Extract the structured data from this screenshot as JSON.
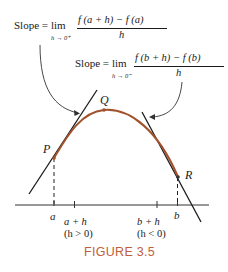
{
  "formula_right_limit": {
    "prefix": "Slope =",
    "lim": "lim",
    "subscript": "h → 0⁺",
    "numerator": "f (a + h) − f (a)",
    "denominator": "h"
  },
  "formula_left_limit": {
    "prefix": "Slope =",
    "lim": "lim",
    "subscript": "h → 0⁻",
    "numerator": "f (b + h) − f (b)",
    "denominator": "h"
  },
  "points": {
    "p": "P",
    "q": "Q",
    "r": "R"
  },
  "axis_labels": {
    "a": "a",
    "a_plus_h": "a + h",
    "a_plus_h_cond": "(h > 0)",
    "b_plus_h": "b + h",
    "b_plus_h_cond": "(h < 0)",
    "b": "b"
  },
  "caption": "FIGURE 3.5",
  "colors": {
    "curve": "#a0522d",
    "lines": "#1a1a1a",
    "caption": "#c0603a"
  }
}
